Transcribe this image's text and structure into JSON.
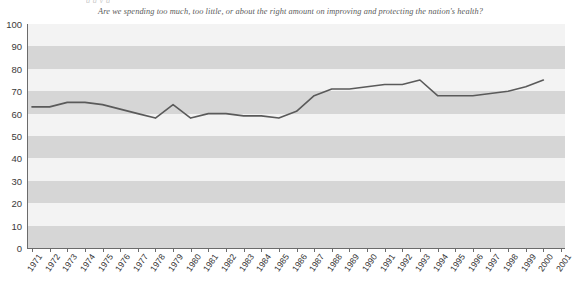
{
  "header_fragment": "g        g   y   g",
  "subtitle": "Are we spending too much, too little, or about the right amount on improving and protecting the nation's health?",
  "colors": {
    "line": "#5a5a5a",
    "band_dark": "#d6d6d6",
    "band_light": "#f3f3f3",
    "axis": "#6b6b6b",
    "text": "#333333"
  },
  "chart_data": {
    "type": "line",
    "title": "",
    "subtitle": "Are we spending too much, too little, or about the right amount on improving and protecting the nation's health?",
    "xlabel": "",
    "ylabel": "",
    "ylim": [
      0,
      100
    ],
    "ytick_labels": [
      "100",
      "90",
      "80",
      "70",
      "60",
      "50",
      "40",
      "30",
      "20",
      "10",
      "0"
    ],
    "yticks": [
      100,
      90,
      80,
      70,
      60,
      50,
      40,
      30,
      20,
      10,
      0
    ],
    "grid": false,
    "banded_background": true,
    "legend": "none",
    "xtick_labels": [
      "1971",
      "1972",
      "1973",
      "1974",
      "1975",
      "1976",
      "1977",
      "1978",
      "1979",
      "1980",
      "1981",
      "1982",
      "1983",
      "1984",
      "1985",
      "1986",
      "1987",
      "1988",
      "1989",
      "1990",
      "1991",
      "1992",
      "1993",
      "1994",
      "1995",
      "1996",
      "1997",
      "1998",
      "1999",
      "2000",
      "2001"
    ],
    "x": [
      1971,
      1972,
      1973,
      1974,
      1975,
      1976,
      1977,
      1978,
      1979,
      1980,
      1981,
      1982,
      1983,
      1984,
      1985,
      1986,
      1987,
      1988,
      1989,
      1990,
      1991,
      1992,
      1993,
      1994,
      1995,
      1996,
      1997,
      1998,
      1999,
      2000
    ],
    "values": [
      63,
      63,
      65,
      65,
      64,
      62,
      60,
      58,
      64,
      58,
      60,
      60,
      59,
      59,
      58,
      61,
      68,
      71,
      71,
      72,
      73,
      73,
      75,
      68,
      68,
      68,
      69,
      70,
      72,
      75
    ],
    "series": [
      {
        "name": "Too little spending on health",
        "values": [
          63,
          63,
          65,
          65,
          64,
          62,
          60,
          58,
          64,
          58,
          60,
          60,
          59,
          59,
          58,
          61,
          68,
          71,
          71,
          72,
          73,
          73,
          75,
          68,
          68,
          68,
          69,
          70,
          72,
          75
        ]
      }
    ]
  }
}
